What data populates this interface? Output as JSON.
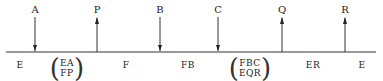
{
  "diagram": {
    "events": [
      {
        "label": "A",
        "direction": "down",
        "x": 35
      },
      {
        "label": "P",
        "direction": "up",
        "x": 97
      },
      {
        "label": "B",
        "direction": "down",
        "x": 160
      },
      {
        "label": "C",
        "direction": "down",
        "x": 218
      },
      {
        "label": "Q",
        "direction": "up",
        "x": 282
      },
      {
        "label": "R",
        "direction": "up",
        "x": 345
      }
    ],
    "segments": [
      {
        "label": "E",
        "x": 20
      },
      {
        "label": "F",
        "x": 126
      },
      {
        "label": "FB",
        "x": 188
      },
      {
        "label": "ER",
        "x": 313
      },
      {
        "label": "E",
        "x": 362
      }
    ],
    "stacked": [
      {
        "top": "EA",
        "bottom": "FP",
        "x": 67
      },
      {
        "top": "FBC",
        "bottom": "EQR",
        "x": 250
      }
    ],
    "line_color": "#333333"
  }
}
